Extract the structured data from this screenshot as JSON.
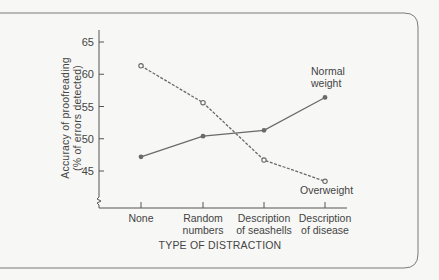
{
  "chart_data": {
    "type": "line",
    "title": "",
    "xlabel": "TYPE OF DISTRACTION",
    "ylabel": [
      "Accuracy of proofreading",
      "(% of errors detected)"
    ],
    "categories": [
      [
        "None"
      ],
      [
        "Random",
        "numbers"
      ],
      [
        "Description",
        "of seashells"
      ],
      [
        "Description",
        "of disease"
      ]
    ],
    "y_ticks": [
      45,
      50,
      55,
      60,
      65
    ],
    "ylim": [
      41,
      66
    ],
    "axis_break": true,
    "grid": false,
    "legend": "inline labels at line ends",
    "series": [
      {
        "name": "Normal weight",
        "label_lines": [
          "Normal",
          "weight"
        ],
        "values": [
          47.2,
          50.4,
          51.3,
          56.4
        ],
        "marker": "filled-circle",
        "line_style": "solid",
        "color": "#6a6a6a"
      },
      {
        "name": "Overweight",
        "label_lines": [
          "Overweight"
        ],
        "values": [
          61.3,
          55.6,
          46.7,
          43.4
        ],
        "marker": "open-circle",
        "line_style": "dashed",
        "color": "#6a6a6a"
      }
    ]
  },
  "colors": {
    "background": "#f7f7f5",
    "frame": "#7a7a7a",
    "axis": "#555555",
    "text": "#444444"
  }
}
